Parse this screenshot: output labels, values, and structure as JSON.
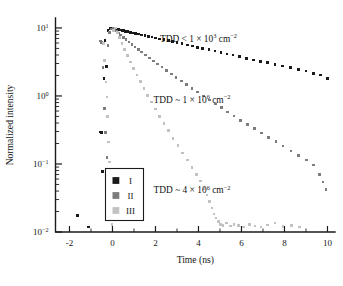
{
  "chart_data": {
    "type": "scatter",
    "title": "",
    "xlabel": "Time (ns)",
    "ylabel": "Normalized intensity",
    "xlim": [
      -2.65,
      10.35
    ],
    "ylim": [
      0.01,
      14.0
    ],
    "yscale": "log",
    "xscale": "linear",
    "grid": false,
    "xticks": [
      -2,
      0,
      2,
      4,
      6,
      8,
      10
    ],
    "xticklabels": [
      "-2",
      "0",
      "2",
      "4",
      "6",
      "8",
      "10"
    ],
    "yticks": [
      0.01,
      0.1,
      1,
      10
    ],
    "yticklabels": [
      "10-2",
      "10-1",
      "100",
      "101"
    ],
    "ytick_mantissa": [
      "10",
      "10",
      "10",
      "10"
    ],
    "ytick_exponent": [
      "-2",
      "-1",
      "0",
      "1"
    ],
    "legend_position": "lower-left",
    "legend_entries": [
      {
        "label": "I",
        "color": "#1a1a1a"
      },
      {
        "label": "II",
        "color": "#7c7c7c"
      },
      {
        "label": "III",
        "color": "#c2c2c2"
      }
    ],
    "annotations": [
      {
        "id": "annotation-series-1",
        "prefix": "TDD < 1 × 10",
        "exponent": "3",
        "suffix": "cm",
        "suffix_exponent": "-2",
        "text": "TDD < 1 × 10^3 cm^-2",
        "x": 4.0,
        "y": 6.2,
        "color": "#121212"
      },
      {
        "id": "annotation-series-2",
        "prefix": "TDD ~ 1 × 10",
        "exponent": "6",
        "suffix": "cm",
        "suffix_exponent": "-2",
        "text": "TDD ~ 1 × 10^6 cm^-2",
        "x": 3.7,
        "y": 0.78,
        "color": "#121212"
      },
      {
        "id": "annotation-series-3",
        "prefix": "TDD ~ 4 × 10",
        "exponent": "6",
        "suffix": "cm",
        "suffix_exponent": "-2",
        "text": "TDD ~ 4 × 10^6 cm^-2",
        "x": 3.7,
        "y": 0.037,
        "color": "#121212"
      }
    ],
    "series": [
      {
        "name": "I",
        "label": "I",
        "color": "#1a1a1a",
        "marker": "square",
        "marker_size": 2.6,
        "decay_lifetime_ns": 5.2,
        "peak_value": 10.0,
        "value_at_10ns": 1.8,
        "points": [
          [
            -1.62,
            0.0175
          ],
          [
            -1.12,
            0.0118
          ],
          [
            -0.58,
            0.295
          ],
          [
            -0.52,
            0.29
          ],
          [
            -0.46,
            0.078
          ],
          [
            -0.4,
            1.8
          ],
          [
            -0.34,
            6.6
          ],
          [
            -0.28,
            2.7
          ],
          [
            -0.2,
            9.2
          ],
          [
            -0.12,
            9.85
          ],
          [
            -0.04,
            10.0
          ],
          [
            0.04,
            9.92
          ],
          [
            0.12,
            9.8
          ],
          [
            0.2,
            9.62
          ],
          [
            0.28,
            9.5
          ],
          [
            0.36,
            9.38
          ],
          [
            0.44,
            9.22
          ],
          [
            0.52,
            9.08
          ],
          [
            0.6,
            8.95
          ],
          [
            0.72,
            8.78
          ],
          [
            0.84,
            8.6
          ],
          [
            0.96,
            8.42
          ],
          [
            1.08,
            8.28
          ],
          [
            1.2,
            8.1
          ],
          [
            1.36,
            7.9
          ],
          [
            1.52,
            7.68
          ],
          [
            1.68,
            7.5
          ],
          [
            1.84,
            7.32
          ],
          [
            2.0,
            7.12
          ],
          [
            2.2,
            6.9
          ],
          [
            2.4,
            6.7
          ],
          [
            2.6,
            6.48
          ],
          [
            2.8,
            6.28
          ],
          [
            3.0,
            6.08
          ],
          [
            3.24,
            5.86
          ],
          [
            3.48,
            5.62
          ],
          [
            3.72,
            5.4
          ],
          [
            3.96,
            5.2
          ],
          [
            4.2,
            5.0
          ],
          [
            4.48,
            4.78
          ],
          [
            4.76,
            4.56
          ],
          [
            5.04,
            4.36
          ],
          [
            5.32,
            4.16
          ],
          [
            5.6,
            3.98
          ],
          [
            5.92,
            3.78
          ],
          [
            6.24,
            3.58
          ],
          [
            6.56,
            3.4
          ],
          [
            6.88,
            3.24
          ],
          [
            7.2,
            3.08
          ],
          [
            7.56,
            2.9
          ],
          [
            7.92,
            2.74
          ],
          [
            8.28,
            2.6
          ],
          [
            8.64,
            2.46
          ],
          [
            9.0,
            2.32
          ],
          [
            9.36,
            2.16
          ],
          [
            9.68,
            2.02
          ],
          [
            10.0,
            1.82
          ]
        ]
      },
      {
        "name": "II",
        "label": "II",
        "color": "#7c7c7c",
        "marker": "square",
        "marker_size": 2.6,
        "decay_lifetime_ns": 1.8,
        "peak_value": 10.0,
        "value_at_10ns": 0.042,
        "points": [
          [
            -0.56,
            6.4
          ],
          [
            -0.5,
            6.1
          ],
          [
            -0.44,
            2.6
          ],
          [
            -0.38,
            0.66
          ],
          [
            -0.32,
            0.29
          ],
          [
            -0.26,
            0.125
          ],
          [
            -0.2,
            5.5
          ],
          [
            -0.14,
            8.6
          ],
          [
            -0.06,
            9.7
          ],
          [
            0.02,
            10.0
          ],
          [
            0.1,
            9.55
          ],
          [
            0.18,
            9.0
          ],
          [
            0.28,
            8.42
          ],
          [
            0.38,
            7.9
          ],
          [
            0.5,
            7.3
          ],
          [
            0.62,
            6.8
          ],
          [
            0.76,
            6.25
          ],
          [
            0.9,
            5.75
          ],
          [
            1.04,
            5.28
          ],
          [
            1.2,
            4.82
          ],
          [
            1.36,
            4.42
          ],
          [
            1.54,
            4.0
          ],
          [
            1.72,
            3.62
          ],
          [
            1.9,
            3.28
          ],
          [
            2.1,
            2.95
          ],
          [
            2.3,
            2.65
          ],
          [
            2.52,
            2.36
          ],
          [
            2.74,
            2.1
          ],
          [
            2.96,
            1.88
          ],
          [
            3.2,
            1.66
          ],
          [
            3.44,
            1.48
          ],
          [
            3.7,
            1.3
          ],
          [
            3.96,
            1.14
          ],
          [
            4.22,
            1.0
          ],
          [
            4.5,
            0.875
          ],
          [
            4.78,
            0.765
          ],
          [
            5.06,
            0.67
          ],
          [
            5.36,
            0.58
          ],
          [
            5.66,
            0.505
          ],
          [
            5.96,
            0.44
          ],
          [
            6.28,
            0.38
          ],
          [
            6.6,
            0.33
          ],
          [
            6.92,
            0.286
          ],
          [
            7.26,
            0.246
          ],
          [
            7.6,
            0.212
          ],
          [
            7.94,
            0.183
          ],
          [
            8.3,
            0.156
          ],
          [
            8.66,
            0.134
          ],
          [
            9.02,
            0.114
          ],
          [
            9.36,
            0.0965
          ],
          [
            9.62,
            0.07
          ],
          [
            9.8,
            0.054
          ],
          [
            9.94,
            0.042
          ]
        ]
      },
      {
        "name": "III",
        "label": "III",
        "color": "#c2c2c2",
        "marker": "square",
        "marker_size": 2.6,
        "decay_lifetime_ns": 0.66,
        "peak_value": 10.0,
        "noise_floor": 0.012,
        "points": [
          [
            -0.42,
            5.9
          ],
          [
            -0.36,
            3.3
          ],
          [
            -0.3,
            1.6
          ],
          [
            -0.26,
            0.96
          ],
          [
            -0.22,
            0.5
          ],
          [
            -0.18,
            0.21
          ],
          [
            -0.14,
            0.107
          ],
          [
            -0.1,
            0.04
          ],
          [
            -0.06,
            0.0215
          ],
          [
            -0.02,
            0.0128
          ],
          [
            0.06,
            9.2
          ],
          [
            0.14,
            10.0
          ],
          [
            0.22,
            8.6
          ],
          [
            0.32,
            7.2
          ],
          [
            0.44,
            5.9
          ],
          [
            0.56,
            4.85
          ],
          [
            0.7,
            3.9
          ],
          [
            0.84,
            3.15
          ],
          [
            0.98,
            2.55
          ],
          [
            1.14,
            2.02
          ],
          [
            1.3,
            1.62
          ],
          [
            1.46,
            1.3
          ],
          [
            1.64,
            1.02
          ],
          [
            1.82,
            0.81
          ],
          [
            2.0,
            0.645
          ],
          [
            2.2,
            0.5
          ],
          [
            2.4,
            0.392
          ],
          [
            2.6,
            0.31
          ],
          [
            2.82,
            0.238
          ],
          [
            3.04,
            0.186
          ],
          [
            3.26,
            0.146
          ],
          [
            3.48,
            0.114
          ],
          [
            3.7,
            0.089
          ],
          [
            3.92,
            0.07
          ],
          [
            4.1,
            0.056
          ],
          [
            4.26,
            0.044
          ],
          [
            4.4,
            0.035
          ],
          [
            4.52,
            0.028
          ],
          [
            4.62,
            0.0225
          ],
          [
            4.72,
            0.0185
          ],
          [
            4.82,
            0.016
          ],
          [
            4.92,
            0.0142
          ],
          [
            5.02,
            0.013
          ],
          [
            5.14,
            0.0125
          ],
          [
            5.3,
            0.0135
          ],
          [
            5.48,
            0.0122
          ],
          [
            5.66,
            0.013
          ],
          [
            5.86,
            0.0125
          ],
          [
            6.1,
            0.0118
          ],
          [
            6.36,
            0.0128
          ],
          [
            6.62,
            0.0122
          ],
          [
            6.9,
            0.0118
          ],
          [
            7.2,
            0.0126
          ],
          [
            7.56,
            0.0135
          ],
          [
            7.94,
            0.012
          ],
          [
            8.34,
            0.0124
          ],
          [
            8.7,
            0.0118
          ]
        ]
      }
    ]
  },
  "figure": {
    "background_color": "#ffffff",
    "axis_color": "#1b1b1b"
  }
}
